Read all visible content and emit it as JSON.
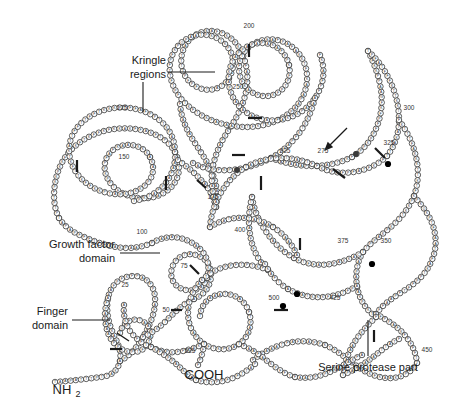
{
  "figure": {
    "type": "protein-domain-schematic",
    "background_color": "#ffffff",
    "line_color": "#1a1a1a",
    "residue_fill": "#ffffff",
    "highlight_fill": "#000000"
  },
  "annotations": {
    "kringle": {
      "line1": "Kringle",
      "line2": "regions"
    },
    "growth_factor": {
      "line1": "Growth factor",
      "line2": "domain"
    },
    "finger": {
      "line1": "Finger",
      "line2": "domain"
    },
    "serine_protease": {
      "line1": "Serine protease part"
    }
  },
  "termini": {
    "n_terminus": "NH",
    "n_terminus_sub": "2",
    "c_terminus": "COOH"
  },
  "residue_numbers": [
    {
      "label": "25",
      "x": 125,
      "y": 287
    },
    {
      "label": "50",
      "x": 166,
      "y": 312
    },
    {
      "label": "75",
      "x": 184,
      "y": 268
    },
    {
      "label": "100",
      "x": 142,
      "y": 234
    },
    {
      "label": "125",
      "x": 122,
      "y": 110
    },
    {
      "label": "150",
      "x": 124,
      "y": 159
    },
    {
      "label": "175",
      "x": 213,
      "y": 199
    },
    {
      "label": "200",
      "x": 249,
      "y": 28
    },
    {
      "label": "225",
      "x": 285,
      "y": 153
    },
    {
      "label": "250",
      "x": 238,
      "y": 89
    },
    {
      "label": "275",
      "x": 323,
      "y": 153
    },
    {
      "label": "300",
      "x": 409,
      "y": 110
    },
    {
      "label": "325",
      "x": 389,
      "y": 145
    },
    {
      "label": "350",
      "x": 386,
      "y": 243
    },
    {
      "label": "375",
      "x": 343,
      "y": 243
    },
    {
      "label": "400",
      "x": 240,
      "y": 232
    },
    {
      "label": "425",
      "x": 335,
      "y": 300
    },
    {
      "label": "450",
      "x": 427,
      "y": 352
    },
    {
      "label": "500",
      "x": 274,
      "y": 300
    },
    {
      "label": "525",
      "x": 190,
      "y": 353
    }
  ],
  "chain_letters": [
    "A",
    "C",
    "D",
    "E",
    "F",
    "G",
    "H",
    "I",
    "K",
    "L",
    "M",
    "N",
    "P",
    "Q",
    "R",
    "S",
    "T",
    "V",
    "W",
    "Y"
  ],
  "counts": {
    "total_residues": 527,
    "kringle_domains": 2,
    "marker_interval": 25
  }
}
